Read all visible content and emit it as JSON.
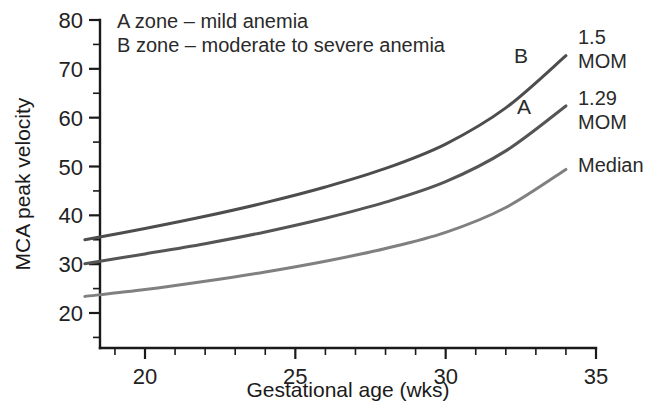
{
  "chart_data": {
    "type": "line",
    "title": "",
    "xlabel": "Gestational age (wks)",
    "ylabel": "MCA peak velocity",
    "xlim": [
      18,
      35
    ],
    "ylim": [
      12.8,
      80
    ],
    "grid": false,
    "legend_position": "right-of-plot",
    "x_ticks_major": [
      20,
      25,
      30,
      35
    ],
    "x_tick_labels": [
      "20",
      "25",
      "30",
      "35"
    ],
    "x_ticks_minor": [
      19,
      21,
      22,
      23,
      24,
      26,
      27,
      28,
      29,
      31,
      32,
      33,
      34
    ],
    "y_ticks_major": [
      20,
      30,
      40,
      50,
      60,
      70,
      80
    ],
    "y_tick_labels": [
      "20",
      "30",
      "40",
      "50",
      "60",
      "70",
      "80"
    ],
    "y_ticks_minor": [
      15,
      25,
      35,
      45,
      55,
      65,
      75
    ],
    "x": [
      18,
      20,
      22,
      24,
      26,
      28,
      30,
      32,
      34
    ],
    "series": [
      {
        "name": "1.5 MOM",
        "label": "1.5\nMOM",
        "label_line1": "1.5",
        "label_line2": "MOM",
        "zone_marker": "B",
        "color": "#4d4d4d",
        "values": [
          35.0,
          37.3,
          39.8,
          42.6,
          45.8,
          49.6,
          54.6,
          62.0,
          72.7
        ]
      },
      {
        "name": "1.29 MOM",
        "label": "1.29\nMOM",
        "label_line1": "1.29",
        "label_line2": "MOM",
        "zone_marker": "A",
        "color": "#555555",
        "values": [
          30.1,
          32.1,
          34.2,
          36.6,
          39.4,
          42.7,
          46.9,
          53.2,
          62.4
        ]
      },
      {
        "name": "Median",
        "label": "Median",
        "label_line1": "Median",
        "label_line2": "",
        "zone_marker": "",
        "color": "#808080",
        "values": [
          23.4,
          24.8,
          26.5,
          28.4,
          30.6,
          33.2,
          36.5,
          41.6,
          49.4
        ]
      }
    ],
    "annotations": [
      {
        "text": "A zone – mild anemia"
      },
      {
        "text": "B zone – moderate to severe anemia"
      }
    ]
  }
}
